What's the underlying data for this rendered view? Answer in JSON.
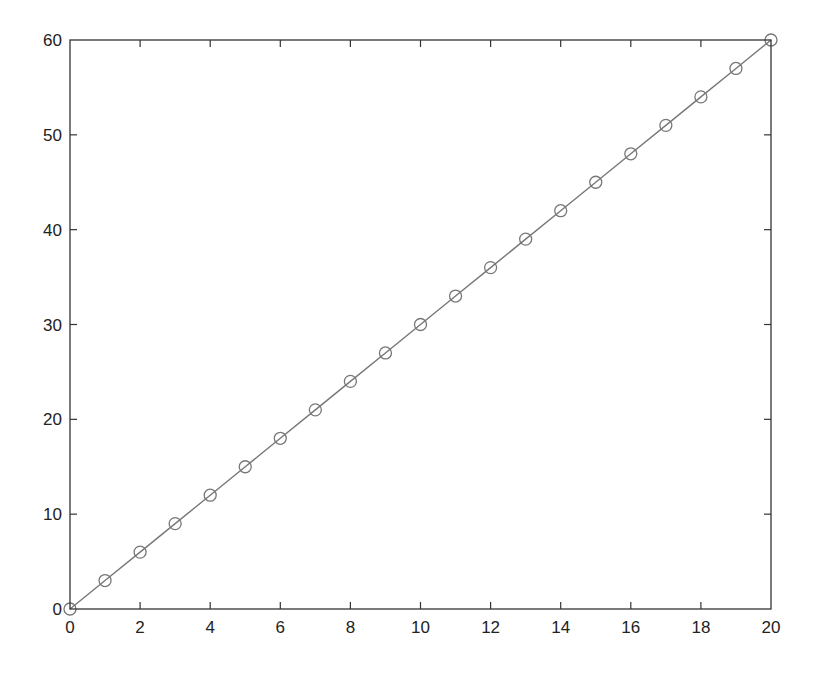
{
  "chart_data": {
    "type": "line",
    "title": "",
    "xlabel": "",
    "ylabel": "",
    "x": [
      0,
      1,
      2,
      3,
      4,
      5,
      6,
      7,
      8,
      9,
      10,
      11,
      12,
      13,
      14,
      15,
      16,
      17,
      18,
      19,
      20
    ],
    "series": [
      {
        "name": "y = 3x",
        "marker": "circle-open",
        "values": [
          0,
          3,
          6,
          9,
          12,
          15,
          18,
          21,
          24,
          27,
          30,
          33,
          36,
          39,
          42,
          45,
          48,
          51,
          54,
          57,
          60
        ]
      }
    ],
    "xlim": [
      0,
      20
    ],
    "ylim": [
      0,
      60
    ],
    "xticks": [
      "0",
      "2",
      "4",
      "6",
      "8",
      "10",
      "12",
      "14",
      "16",
      "18",
      "20"
    ],
    "yticks": [
      "0",
      "10",
      "20",
      "30",
      "40",
      "50",
      "60"
    ],
    "grid": false,
    "legend": null
  },
  "colors": {
    "line": "#777777",
    "marker": "#777777",
    "axes": "#333333",
    "text": "#222222"
  }
}
